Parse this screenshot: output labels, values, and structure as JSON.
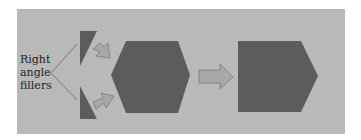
{
  "diagram": {
    "label_lines": [
      "Right",
      "angle",
      "fillers"
    ],
    "colors": {
      "panel": "#b9b9b9",
      "shape_fill": "#5c5c5c",
      "arrow_fill": "#a8a8a8",
      "arrow_stroke": "#7a7a7a",
      "pointer_line": "#666666"
    },
    "shapes": [
      "triangle-top",
      "triangle-bottom",
      "hexagon",
      "pentagon"
    ],
    "arrows": [
      "arrow-top-diagonal",
      "arrow-bottom-diagonal",
      "arrow-right"
    ]
  }
}
